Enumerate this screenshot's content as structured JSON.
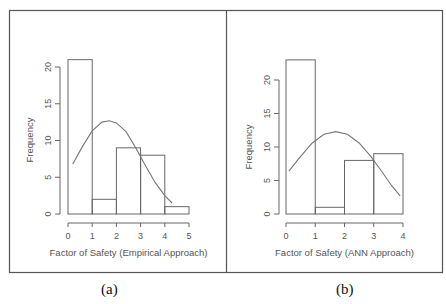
{
  "figure": {
    "border_color": "#555555",
    "line_color": "#666666",
    "curve_color": "#777777",
    "text_color": "#555555"
  },
  "chart_data": [
    {
      "type": "bar",
      "subtype": "histogram",
      "panel_label": "(a)",
      "title": "",
      "xlabel": "Factor of Safety (Empirical Approach)",
      "ylabel": "Frequency",
      "bins": [
        [
          0,
          1
        ],
        [
          1,
          2
        ],
        [
          2,
          3
        ],
        [
          3,
          4
        ],
        [
          4,
          5
        ]
      ],
      "categories": [
        "0-1",
        "1-2",
        "2-3",
        "3-4",
        "4-5"
      ],
      "values": [
        21,
        2,
        9,
        8,
        1
      ],
      "xticks": [
        0,
        1,
        2,
        3,
        4,
        5
      ],
      "yticks": [
        0,
        5,
        10,
        15,
        20
      ],
      "xlim": [
        0,
        5
      ],
      "ylim": [
        0,
        21
      ],
      "grid": false,
      "overlay_curve": {
        "name": "normal fit",
        "x": [
          0.2,
          0.6,
          1.0,
          1.4,
          1.7,
          2.0,
          2.4,
          2.8,
          3.2,
          3.6,
          4.0,
          4.3
        ],
        "y": [
          6.8,
          9.2,
          11.3,
          12.5,
          12.7,
          12.4,
          11.2,
          9.0,
          6.6,
          4.3,
          2.5,
          1.5
        ]
      }
    },
    {
      "type": "bar",
      "subtype": "histogram",
      "panel_label": "(b)",
      "title": "",
      "xlabel": "Factor of Safety (ANN Approach)",
      "ylabel": "Frequency",
      "bins": [
        [
          0,
          1
        ],
        [
          1,
          2
        ],
        [
          2,
          3
        ],
        [
          3,
          4
        ]
      ],
      "categories": [
        "0-1",
        "1-2",
        "2-3",
        "3-4"
      ],
      "values": [
        23,
        1,
        8,
        9
      ],
      "xticks": [
        0,
        1,
        2,
        3,
        4
      ],
      "yticks": [
        0,
        5,
        10,
        15,
        20
      ],
      "xlim": [
        0,
        4
      ],
      "ylim": [
        0,
        23
      ],
      "grid": false,
      "overlay_curve": {
        "name": "normal fit",
        "x": [
          0.1,
          0.5,
          0.9,
          1.3,
          1.7,
          2.1,
          2.5,
          2.9,
          3.3,
          3.6,
          3.9
        ],
        "y": [
          6.4,
          8.6,
          10.6,
          11.9,
          12.3,
          11.9,
          10.6,
          8.6,
          6.2,
          4.3,
          2.7
        ]
      }
    }
  ]
}
